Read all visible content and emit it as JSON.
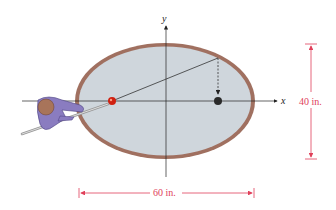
{
  "figure": {
    "axes": {
      "x_label": "x",
      "y_label": "y"
    },
    "table": {
      "shape": "ellipse",
      "felt_color": "#cfd6dc",
      "rail_color": "#a07060"
    },
    "dimensions": {
      "width_label": "60 in.",
      "height_label": "40 in.",
      "color": "#e0405a"
    },
    "balls": {
      "cue_ball_color": "#d02010",
      "target_ball_color": "#2a2a2a"
    },
    "player": {
      "body_color": "#8a7cc0",
      "head_color": "#a8745a"
    }
  }
}
